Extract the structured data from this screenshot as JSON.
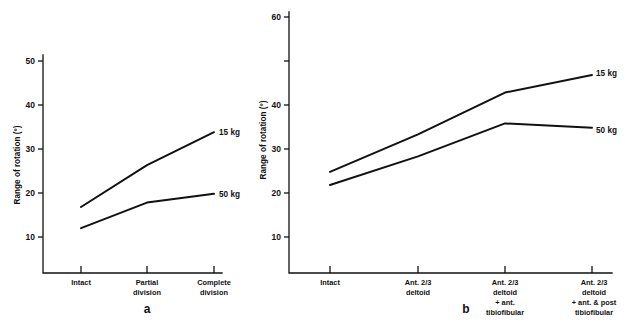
{
  "figure": {
    "background": "#ffffff",
    "ink": "#111111"
  },
  "chart_data": [
    {
      "panel": "a",
      "panel_letter": "a",
      "type": "line",
      "title": "",
      "xlabel": "",
      "ylabel": "Range of rotation (°)",
      "categories": [
        "Intact",
        "Partial division",
        "Complete division"
      ],
      "category_lines": [
        [
          "Intact"
        ],
        [
          "Partial",
          "division"
        ],
        [
          "Complete",
          "division"
        ]
      ],
      "yticks": [
        10,
        20,
        30,
        40,
        50
      ],
      "ylim": [
        0,
        50
      ],
      "grid": false,
      "legend": "inline-right-end",
      "series": [
        {
          "name": "15 kg",
          "label": "15 kg",
          "values": [
            15,
            24.5,
            32
          ]
        },
        {
          "name": "50 kg",
          "label": "50 kg",
          "values": [
            10.2,
            16,
            18
          ]
        }
      ]
    },
    {
      "panel": "b",
      "panel_letter": "b",
      "type": "line",
      "title": "",
      "xlabel": "",
      "ylabel": "Range of rotation (°)",
      "categories": [
        "Intact",
        "Ant. 2/3 deltoid",
        "Ant. 2/3 deltoid + ant. tibiofibular",
        "Ant. 2/3 deltoid + ant. & post tibiofibular"
      ],
      "category_lines": [
        [
          "Intact"
        ],
        [
          "Ant. 2/3",
          "deltoid"
        ],
        [
          "Ant. 2/3",
          "deltoid",
          "+ ant.",
          "tibiofibular"
        ],
        [
          "Ant. 2/3",
          "deltoid",
          "+ ant. & post",
          "tibiofibular"
        ]
      ],
      "yticks": [
        10,
        20,
        30,
        40,
        60
      ],
      "yticks_all": [
        10,
        20,
        30,
        40,
        50,
        60
      ],
      "ylim": [
        0,
        60
      ],
      "grid": false,
      "legend": "inline-right-end",
      "series": [
        {
          "name": "15 kg",
          "label": "15 kg",
          "values": [
            23,
            31.5,
            41,
            45
          ]
        },
        {
          "name": "50 kg",
          "label": "50 kg",
          "values": [
            20,
            26.5,
            34,
            33
          ]
        }
      ]
    }
  ],
  "panel_a": {
    "ylabel": "Range of rotation (°)",
    "ytick_labels": [
      "50",
      "40",
      "30",
      "20",
      "10"
    ],
    "xtick_labels": [
      {
        "l1": "Intact",
        "l2": "",
        "l3": "",
        "l4": ""
      },
      {
        "l1": "Partial",
        "l2": "division",
        "l3": "",
        "l4": ""
      },
      {
        "l1": "Complete",
        "l2": "division",
        "l3": "",
        "l4": ""
      }
    ],
    "series_labels": [
      "15 kg",
      "50 kg"
    ],
    "letter": "a"
  },
  "panel_b": {
    "ylabel": "Range of rotation (°)",
    "ytick_labels": [
      "60",
      "40",
      "30",
      "20",
      "10"
    ],
    "xtick_labels": [
      {
        "l1": "Intact",
        "l2": "",
        "l3": "",
        "l4": ""
      },
      {
        "l1": "Ant. 2/3",
        "l2": "deltoid",
        "l3": "",
        "l4": ""
      },
      {
        "l1": "Ant. 2/3",
        "l2": "deltoid",
        "l3": "+ ant.",
        "l4": "tibiofibular"
      },
      {
        "l1": "Ant. 2/3",
        "l2": "deltoid",
        "l3": "+ ant. & post",
        "l4": "tibiofibular"
      }
    ],
    "series_labels": [
      "15 kg",
      "50 kg"
    ],
    "letter": "b"
  }
}
